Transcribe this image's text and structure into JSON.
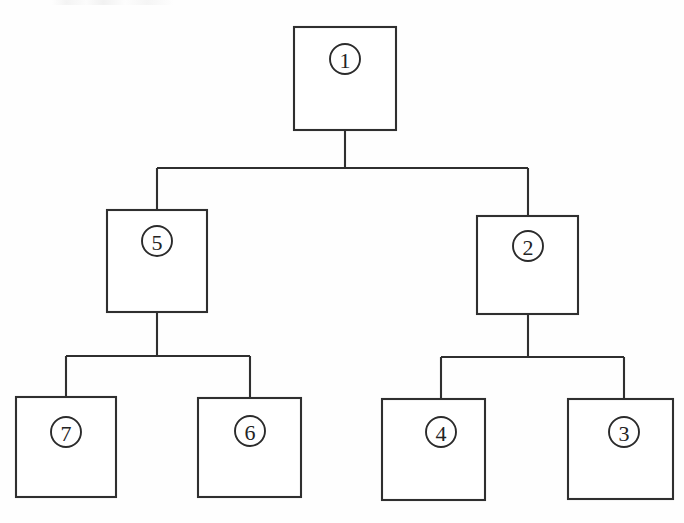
{
  "diagram": {
    "type": "tree",
    "canvas": {
      "width": 684,
      "height": 523
    },
    "style": {
      "background_color": "#fefefe",
      "stroke_color": "#2f2f2f",
      "box_fill_color": "#ffffff",
      "label_color": "#232323"
    },
    "nodes": [
      {
        "id": "node-1",
        "label": "1",
        "level": 0,
        "box": {
          "x": 294,
          "y": 27,
          "width": 102,
          "height": 103
        },
        "marker": {
          "cx": 345,
          "cy": 59,
          "r": 15
        }
      },
      {
        "id": "node-5",
        "label": "5",
        "level": 1,
        "box": {
          "x": 107,
          "y": 210,
          "width": 100,
          "height": 102
        },
        "marker": {
          "cx": 157,
          "cy": 241,
          "r": 15
        }
      },
      {
        "id": "node-2",
        "label": "2",
        "level": 1,
        "box": {
          "x": 477,
          "y": 216,
          "width": 101,
          "height": 98
        },
        "marker": {
          "cx": 528,
          "cy": 246,
          "r": 15
        }
      },
      {
        "id": "node-7",
        "label": "7",
        "level": 2,
        "box": {
          "x": 16,
          "y": 397,
          "width": 100,
          "height": 100
        },
        "marker": {
          "cx": 66,
          "cy": 432,
          "r": 15
        }
      },
      {
        "id": "node-6",
        "label": "6",
        "level": 2,
        "box": {
          "x": 198,
          "y": 398,
          "width": 103,
          "height": 99
        },
        "marker": {
          "cx": 250,
          "cy": 431,
          "r": 15
        }
      },
      {
        "id": "node-4",
        "label": "4",
        "level": 2,
        "box": {
          "x": 382,
          "y": 399,
          "width": 103,
          "height": 101
        },
        "marker": {
          "cx": 441,
          "cy": 432,
          "r": 15
        }
      },
      {
        "id": "node-3",
        "label": "3",
        "level": 2,
        "box": {
          "x": 568,
          "y": 399,
          "width": 105,
          "height": 100
        },
        "marker": {
          "cx": 624,
          "cy": 432,
          "r": 15
        }
      }
    ],
    "edges": [
      {
        "id": "edge-1-5",
        "from": "node-1",
        "to": "node-5"
      },
      {
        "id": "edge-1-2",
        "from": "node-1",
        "to": "node-2"
      },
      {
        "id": "edge-5-7",
        "from": "node-5",
        "to": "node-7"
      },
      {
        "id": "edge-5-6",
        "from": "node-5",
        "to": "node-6"
      },
      {
        "id": "edge-2-4",
        "from": "node-2",
        "to": "node-4"
      },
      {
        "id": "edge-2-3",
        "from": "node-2",
        "to": "node-3"
      }
    ],
    "connector_paths": {
      "root_branch": "M345,130 L345,168 M157,168 L528,168 M157,168 L157,211 M528,168 L528,217",
      "node5_branch": "M157,312 L157,356 M66,356 L250,356 M66,356 L66,398 M250,356 L250,399",
      "node2_branch": "M528,314 L528,357 M441,357 L624,357 M441,357 L441,400 M624,357 L624,400"
    }
  }
}
